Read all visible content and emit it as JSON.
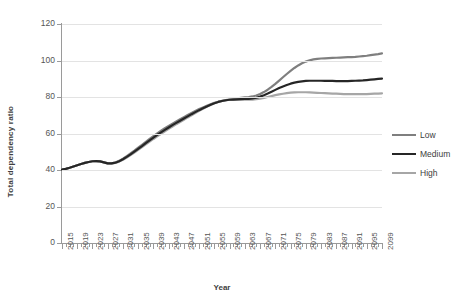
{
  "chart_data": {
    "type": "line",
    "title": "",
    "xlabel": "Year",
    "ylabel": "Total dependency ratio",
    "xlim": [
      2015,
      2099
    ],
    "ylim": [
      0,
      120
    ],
    "y_ticks": [
      0,
      20,
      40,
      60,
      80,
      100,
      120
    ],
    "x_tick_step": 1,
    "x_label_step": 4,
    "grid": "horizontal",
    "legend_position": "right",
    "x_tick_labels": [
      "2015",
      "2019",
      "2023",
      "2027",
      "2031",
      "2035",
      "2039",
      "2043",
      "2047",
      "2051",
      "2055",
      "2059",
      "2063",
      "2067",
      "2071",
      "2075",
      "2079",
      "2083",
      "2087",
      "2091",
      "2095",
      "2099"
    ],
    "x": [
      2015,
      2016,
      2017,
      2018,
      2019,
      2020,
      2021,
      2022,
      2023,
      2024,
      2025,
      2026,
      2027,
      2028,
      2029,
      2030,
      2031,
      2032,
      2033,
      2034,
      2035,
      2036,
      2037,
      2038,
      2039,
      2040,
      2041,
      2042,
      2043,
      2044,
      2045,
      2046,
      2047,
      2048,
      2049,
      2050,
      2051,
      2052,
      2053,
      2054,
      2055,
      2056,
      2057,
      2058,
      2059,
      2060,
      2061,
      2062,
      2063,
      2064,
      2065,
      2066,
      2067,
      2068,
      2069,
      2070,
      2071,
      2072,
      2073,
      2074,
      2075,
      2076,
      2077,
      2078,
      2079,
      2080,
      2081,
      2082,
      2083,
      2084,
      2085,
      2086,
      2087,
      2088,
      2089,
      2090,
      2091,
      2092,
      2093,
      2094,
      2095,
      2096,
      2097,
      2098,
      2099
    ],
    "series": [
      {
        "name": "Low",
        "color": "#7f7f7f",
        "width": 2.2,
        "values": [
          40.2,
          40.6,
          41.2,
          41.9,
          42.6,
          43.3,
          43.9,
          44.4,
          44.8,
          44.9,
          44.7,
          44.2,
          43.6,
          43.6,
          44.1,
          45.0,
          46.2,
          47.6,
          49.1,
          50.6,
          52.2,
          53.8,
          55.4,
          57.0,
          58.6,
          60.1,
          61.5,
          62.9,
          64.2,
          65.4,
          66.6,
          67.8,
          69.0,
          70.2,
          71.3,
          72.4,
          73.4,
          74.3,
          75.2,
          76.0,
          76.8,
          77.4,
          77.9,
          78.3,
          78.6,
          78.9,
          79.2,
          79.5,
          79.8,
          80.0,
          80.3,
          80.8,
          81.6,
          82.7,
          84.0,
          85.5,
          87.2,
          89.0,
          90.8,
          92.6,
          94.3,
          95.9,
          97.3,
          98.5,
          99.4,
          100.1,
          100.6,
          100.9,
          101.1,
          101.2,
          101.3,
          101.4,
          101.5,
          101.6,
          101.7,
          101.8,
          101.9,
          102.0,
          102.2,
          102.4,
          102.6,
          102.9,
          103.2,
          103.5,
          103.9
        ]
      },
      {
        "name": "Medium",
        "color": "#262626",
        "width": 2.2,
        "values": [
          40.2,
          40.6,
          41.2,
          41.9,
          42.6,
          43.3,
          43.9,
          44.4,
          44.8,
          44.9,
          44.7,
          44.2,
          43.6,
          43.6,
          44.0,
          44.8,
          45.9,
          47.2,
          48.6,
          50.1,
          51.6,
          53.1,
          54.7,
          56.2,
          57.7,
          59.2,
          60.6,
          62.0,
          63.3,
          64.6,
          65.8,
          67.0,
          68.2,
          69.4,
          70.6,
          71.7,
          72.8,
          73.8,
          74.8,
          75.7,
          76.6,
          77.3,
          77.8,
          78.2,
          78.5,
          78.6,
          78.7,
          78.8,
          78.9,
          79.0,
          79.2,
          79.6,
          80.2,
          81.0,
          81.9,
          82.9,
          83.9,
          84.9,
          85.8,
          86.6,
          87.3,
          87.9,
          88.3,
          88.6,
          88.8,
          88.9,
          88.9,
          88.9,
          88.9,
          88.8,
          88.8,
          88.8,
          88.7,
          88.7,
          88.7,
          88.7,
          88.8,
          88.9,
          89.0,
          89.1,
          89.3,
          89.5,
          89.7,
          89.9,
          90.1
        ]
      },
      {
        "name": "High",
        "color": "#a6a6a6",
        "width": 2.2,
        "values": [
          40.2,
          40.6,
          41.2,
          41.9,
          42.6,
          43.3,
          43.9,
          44.4,
          44.8,
          44.9,
          44.7,
          44.2,
          43.6,
          43.5,
          43.9,
          44.6,
          45.6,
          46.8,
          48.2,
          49.6,
          51.0,
          52.5,
          54.0,
          55.5,
          57.0,
          58.4,
          59.8,
          61.2,
          62.5,
          63.8,
          65.1,
          66.3,
          67.5,
          68.8,
          70.0,
          71.2,
          72.4,
          73.5,
          74.6,
          75.6,
          76.6,
          77.3,
          77.8,
          78.2,
          78.5,
          78.5,
          78.5,
          78.5,
          78.5,
          78.5,
          78.6,
          78.8,
          79.1,
          79.5,
          80.0,
          80.5,
          81.0,
          81.4,
          81.8,
          82.1,
          82.4,
          82.5,
          82.6,
          82.6,
          82.6,
          82.5,
          82.4,
          82.3,
          82.2,
          82.1,
          82.0,
          81.9,
          81.8,
          81.7,
          81.6,
          81.6,
          81.6,
          81.6,
          81.6,
          81.6,
          81.6,
          81.7,
          81.8,
          81.9,
          82.0
        ]
      }
    ]
  },
  "legend": {
    "items": [
      {
        "label": "Low"
      },
      {
        "label": "Medium"
      },
      {
        "label": "High"
      }
    ]
  }
}
